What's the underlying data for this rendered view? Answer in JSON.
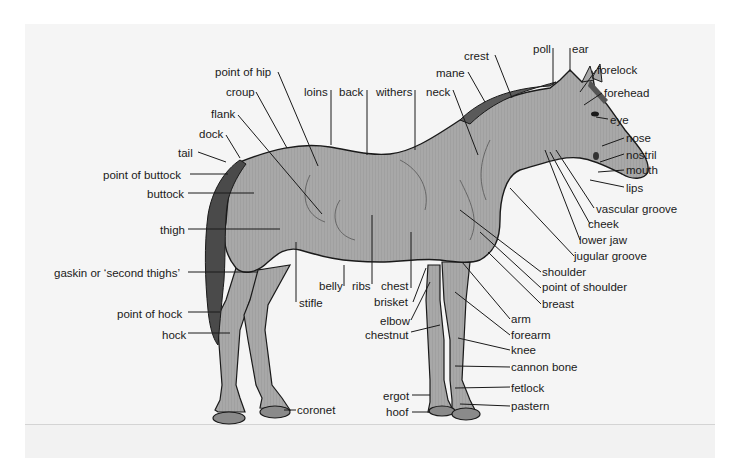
{
  "diagram": {
    "colors": {
      "background_panel": "#f5f5f5",
      "body_fill": "#a8a8a8",
      "hoof_fill": "#8a8a8a",
      "tail_fill": "#4a4a4a",
      "outline": "#1a1a1a",
      "label_text": "#1a1a1a"
    },
    "labels": {
      "point_of_hip": "point of hip",
      "croup": "croup",
      "flank": "flank",
      "dock": "dock",
      "tail": "tail",
      "point_of_buttock": "point of buttock",
      "buttock": "buttock",
      "thigh": "thigh",
      "gaskin": "gaskin or ‘second thighs’",
      "point_of_hock": "point of hock",
      "hock": "hock",
      "coronet": "coronet",
      "stifle": "stifle",
      "belly": "belly",
      "ribs": "ribs",
      "chest": "chest",
      "brisket": "brisket",
      "elbow": "elbow",
      "chestnut": "chestnut",
      "ergot": "ergot",
      "hoof": "hoof",
      "loins": "loins",
      "back": "back",
      "withers": "withers",
      "neck": "neck",
      "mane": "mane",
      "crest": "crest",
      "poll": "poll",
      "ear": "ear",
      "forelock": "forelock",
      "forehead": "forehead",
      "eye": "eye",
      "nose": "nose",
      "nostril": "nostril",
      "mouth": "mouth",
      "lips": "lips",
      "vascular_groove": "vascular groove",
      "cheek": "cheek",
      "lower_jaw": "lower jaw",
      "jugular_groove": "jugular groove",
      "shoulder": "shoulder",
      "point_of_shoulder": "point of shoulder",
      "breast": "breast",
      "arm": "arm",
      "forearm": "forearm",
      "knee": "knee",
      "cannon_bone": "cannon bone",
      "fetlock": "fetlock",
      "pastern": "pastern"
    }
  }
}
